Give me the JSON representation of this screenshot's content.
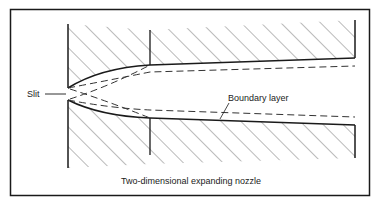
{
  "figure": {
    "caption": "Two-dimensional expanding nozzle",
    "labels": {
      "slit": "Slit",
      "boundary_layer": "Boundary layer"
    }
  },
  "colors": {
    "ink": "#1a1a1a",
    "hatch": "#555555",
    "background": "#ffffff"
  }
}
